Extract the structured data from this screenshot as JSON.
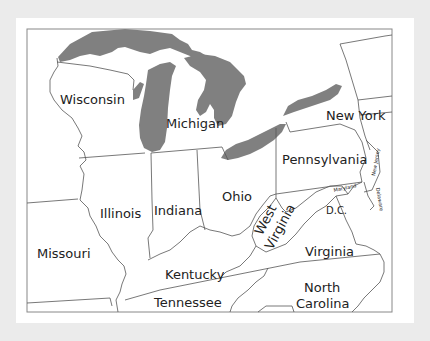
{
  "map": {
    "title": "",
    "colors": {
      "background": "#ebebeb",
      "card": "#ffffff",
      "land": "#ffffff",
      "water": "#808080",
      "border": "#555555",
      "text": "#222222"
    },
    "states": [
      {
        "name": "Wisconsin"
      },
      {
        "name": "Michigan"
      },
      {
        "name": "New York"
      },
      {
        "name": "Pennsylvania"
      },
      {
        "name": "Ohio"
      },
      {
        "name": "Indiana"
      },
      {
        "name": "Illinois"
      },
      {
        "name": "Missouri"
      },
      {
        "name": "Kentucky"
      },
      {
        "name": "Tennessee"
      },
      {
        "name": "West Virginia",
        "lines": [
          "West",
          "Virginia"
        ]
      },
      {
        "name": "Virginia"
      },
      {
        "name": "North Carolina",
        "lines": [
          "North",
          "Carolina"
        ]
      },
      {
        "name": "Maryland"
      },
      {
        "name": "New Jersey"
      },
      {
        "name": "Delaware"
      },
      {
        "name": "D.C."
      }
    ],
    "water_bodies": [
      "Lake Superior",
      "Lake Michigan",
      "Lake Huron",
      "Lake Erie",
      "Lake Ontario"
    ]
  }
}
